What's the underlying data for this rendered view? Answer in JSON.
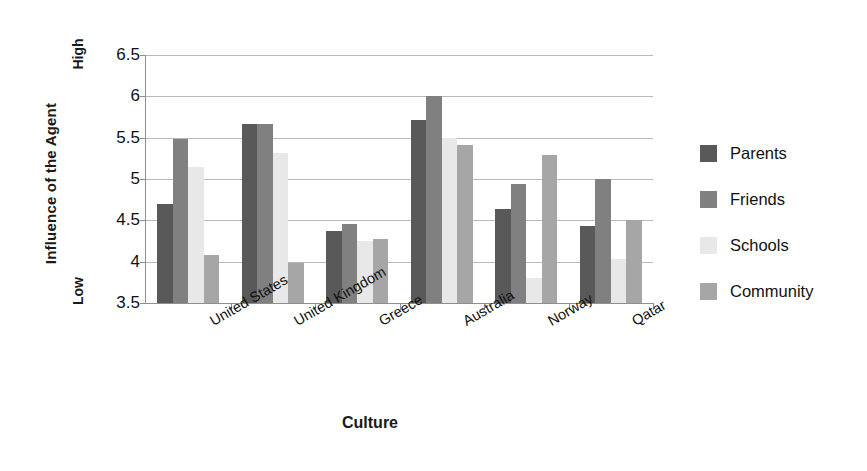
{
  "chart_data": {
    "type": "bar",
    "title": "",
    "xlabel": "Culture",
    "ylabel": "Influence of the Agent",
    "ylim": [
      3.5,
      6.5
    ],
    "ytick_step": 0.5,
    "yticks": [
      "6.5",
      "6",
      "5.5",
      "5",
      "4.5",
      "4",
      "3.5"
    ],
    "ytick_values": [
      6.5,
      6,
      5.5,
      5,
      4.5,
      4,
      3.5
    ],
    "grid": true,
    "legend_position": "right",
    "axis_low_label": "Low",
    "axis_high_label": "High",
    "categories": [
      "United States",
      "United Kingdom",
      "Greece",
      "Australia",
      "Norway",
      "Qatar"
    ],
    "series": [
      {
        "name": "Parents",
        "color": "#595959",
        "values": [
          4.7,
          5.66,
          4.37,
          5.71,
          4.64,
          4.43
        ]
      },
      {
        "name": "Friends",
        "color": "#808080",
        "values": [
          5.48,
          5.66,
          4.46,
          6.0,
          4.94,
          5.0
        ]
      },
      {
        "name": "Schools",
        "color": "#e8e8e8",
        "values": [
          5.14,
          5.31,
          4.25,
          5.5,
          3.8,
          4.03
        ]
      },
      {
        "name": "Community",
        "color": "#a6a6a6",
        "values": [
          4.08,
          3.98,
          4.27,
          5.41,
          5.29,
          4.5
        ]
      }
    ]
  }
}
